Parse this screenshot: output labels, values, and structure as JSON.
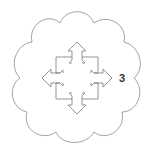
{
  "diagram": {
    "shape": "cloud-outline",
    "icon": "move-arrows-icon",
    "label": "3",
    "colors": {
      "stroke": "#8a8a8a",
      "arrow_stroke": "#7a7a7a",
      "label": "#333333",
      "background": "#ffffff"
    }
  }
}
